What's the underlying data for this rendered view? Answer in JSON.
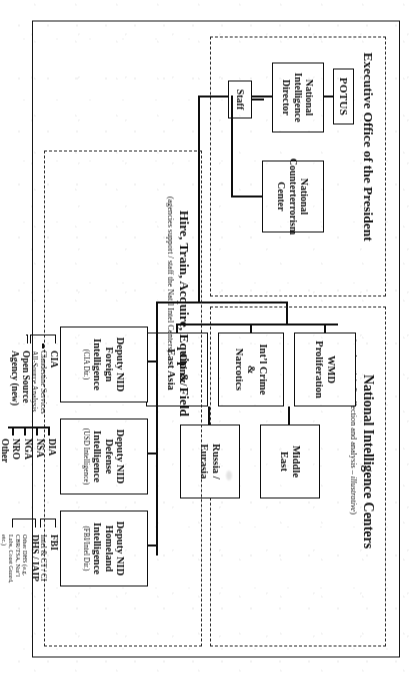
{
  "document": {
    "type": "organization-chart",
    "orientation": "landscape-rotated-90",
    "title_visible": false
  },
  "executive_office": {
    "section_title": "Executive Office of the President",
    "nodes": {
      "potus": "POTUS",
      "nid_line1": "National Intelligence",
      "nid_line2": "Director",
      "staff": "Staff",
      "nctc_line1": "National",
      "nctc_line2": "Counterterrorism",
      "nctc_line3": "Center"
    }
  },
  "national_intelligence_centers": {
    "section_title": "National Intelligence Centers",
    "section_subtitle_pre": "(conduct “joint” collection and analysis – ",
    "section_subtitle_italic": "illustrative",
    "section_subtitle_post": ")",
    "centers": [
      {
        "line1": "WMD",
        "line2": "Proliferation"
      },
      {
        "line1": "Int’l Crime",
        "line2": "&",
        "line3": "Narcotics"
      },
      {
        "line1": "China /",
        "line2": "East Asia"
      },
      {
        "line1": "Middle",
        "line2": "East"
      },
      {
        "line1": "Russia /",
        "line2": "Eurasia"
      }
    ]
  },
  "hire_train_acquire": {
    "section_title": "Hire, Train, Acquire, Equip & Field",
    "section_subtitle": "(agencies support / staff the Nat’l Intel Centers)",
    "deputies": [
      {
        "line1": "Deputy NID",
        "line2": "Foreign",
        "line3": "Intelligence",
        "paren": "(CIA Dir.)",
        "agencies": [
          {
            "label": "CIA",
            "size": "big"
          },
          {
            "label": "Clandestine Services",
            "size": "med"
          },
          {
            "label": "All-Source Analysis",
            "size": "med"
          },
          {
            "label": "Open Source",
            "size": "big"
          },
          {
            "label": "Agency (new)",
            "size": "big"
          }
        ]
      },
      {
        "line1": "Deputy NID",
        "line2": "Defense",
        "line3": "Intelligence",
        "paren": "(USD Intelligence)",
        "agencies": [
          {
            "label": "DIA",
            "size": "big"
          },
          {
            "label": "NSA",
            "size": "big"
          },
          {
            "label": "NGA",
            "size": "big"
          },
          {
            "label": "NRO",
            "size": "big"
          },
          {
            "label": "Other",
            "size": "big"
          }
        ]
      },
      {
        "line1": "Deputy NID",
        "line2": "Homeland",
        "line3": "Intelligence",
        "paren": "(FBI/Intel Dir.)",
        "agencies": [
          {
            "label": "FBI",
            "size": "big"
          },
          {
            "label": "Intel & CT / CI",
            "size": "med"
          },
          {
            "label": "DHS / IAIP",
            "size": "big"
          },
          {
            "label": "Other DHS (e.g.",
            "size": "sm"
          },
          {
            "label": "CBR/TSA, Nat’l",
            "size": "sm"
          },
          {
            "label": "Labs, Coast Guard,",
            "size": "sm"
          },
          {
            "label": "etc.)",
            "size": "sm"
          }
        ]
      }
    ]
  },
  "caption": "Modernizing of CIA, Federal Bureau of Investigation and other capabilities"
}
